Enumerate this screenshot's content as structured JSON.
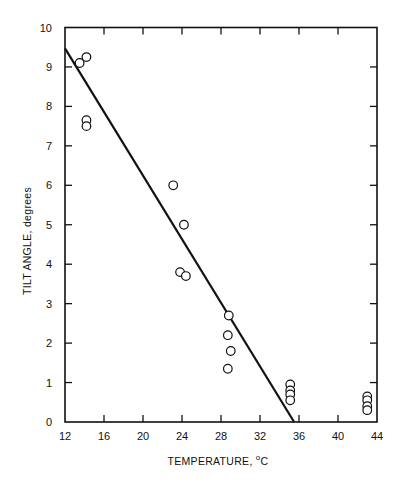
{
  "chart_data": {
    "type": "scatter",
    "title": "",
    "xlabel": "TEMPERATURE, °C",
    "xlabel_main": "TEMPERATURE, ",
    "xlabel_unit_sup": "o",
    "xlabel_unit": "C",
    "ylabel": "TILT ANGLE, degrees",
    "xlim": [
      12,
      44
    ],
    "ylim": [
      0,
      10
    ],
    "xticks": [
      12,
      16,
      20,
      24,
      28,
      32,
      36,
      40,
      44
    ],
    "yticks": [
      0,
      1,
      2,
      3,
      4,
      5,
      6,
      7,
      8,
      9,
      10
    ],
    "grid": false,
    "legend": null,
    "series": [
      {
        "name": "measured",
        "marker": "open-circle",
        "points": [
          {
            "x": 13.5,
            "y": 9.1
          },
          {
            "x": 14.2,
            "y": 9.25
          },
          {
            "x": 14.2,
            "y": 7.65
          },
          {
            "x": 14.2,
            "y": 7.5
          },
          {
            "x": 23.1,
            "y": 6.0
          },
          {
            "x": 24.2,
            "y": 5.0
          },
          {
            "x": 23.8,
            "y": 3.8
          },
          {
            "x": 24.4,
            "y": 3.7
          },
          {
            "x": 28.8,
            "y": 2.7
          },
          {
            "x": 28.7,
            "y": 2.2
          },
          {
            "x": 29.0,
            "y": 1.8
          },
          {
            "x": 28.7,
            "y": 1.35
          },
          {
            "x": 35.1,
            "y": 0.95
          },
          {
            "x": 35.1,
            "y": 0.8
          },
          {
            "x": 35.1,
            "y": 0.7
          },
          {
            "x": 35.1,
            "y": 0.55
          },
          {
            "x": 43.0,
            "y": 0.65
          },
          {
            "x": 43.0,
            "y": 0.55
          },
          {
            "x": 43.0,
            "y": 0.4
          },
          {
            "x": 43.0,
            "y": 0.3
          }
        ]
      },
      {
        "name": "fit line",
        "type": "line",
        "points": [
          {
            "x": 12,
            "y": 9.47
          },
          {
            "x": 35.5,
            "y": 0
          }
        ]
      }
    ]
  },
  "colors": {
    "ink": "#111111",
    "background": "#ffffff"
  }
}
